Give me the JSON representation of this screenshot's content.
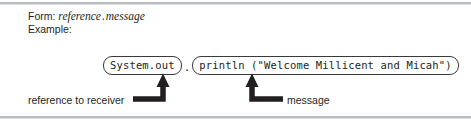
{
  "figure": {
    "background_color": "#ffffff",
    "rule_color": "#b8bbc0",
    "text_color": "#231f20",
    "stroke_color": "#3a3a3c"
  },
  "prose": {
    "form_label": "Form:",
    "form_reference": "reference",
    "form_separator": ".",
    "form_message": "message",
    "example_label": "Example:"
  },
  "code": {
    "receiver_pill": "System.out",
    "joiner": ".",
    "message_pill": "println (\"Welcome Millicent and Micah\")"
  },
  "captions": {
    "receiver": "reference to receiver",
    "message": "message"
  },
  "connectors": [
    {
      "name": "receiver-connector",
      "points_to": "System.out",
      "arrow_direction": "up",
      "elbow_direction": "left",
      "arrow_x": 163,
      "arrow_tip_y": 75,
      "elbow_y": 99,
      "elbow_end_x": 133
    },
    {
      "name": "message-connector",
      "points_to": "println (\"Welcome Millicent and Micah\")",
      "arrow_direction": "up",
      "elbow_direction": "right",
      "arrow_x": 252,
      "arrow_tip_y": 75,
      "elbow_y": 99,
      "elbow_end_x": 283
    }
  ]
}
